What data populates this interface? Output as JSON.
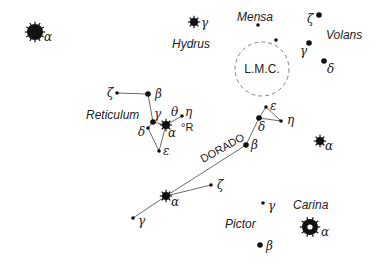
{
  "constellations": {
    "hydrus": {
      "label": "Hydrus",
      "x": 172,
      "y": 48
    },
    "mensa": {
      "label": "Mensa",
      "x": 237,
      "y": 21
    },
    "volans": {
      "label": "Volans",
      "x": 326,
      "y": 39
    },
    "reticulum": {
      "label": "Reticulum",
      "x": 86,
      "y": 119
    },
    "dorado": {
      "label": "DORADO",
      "x": 203,
      "y": 163,
      "rotate": -29
    },
    "carina": {
      "label": "Carina",
      "x": 293,
      "y": 209
    },
    "pictor": {
      "label": "Pictor",
      "x": 225,
      "y": 228
    }
  },
  "lmc": {
    "label": "L.M.C.",
    "cx": 262,
    "cy": 69,
    "r": 27
  },
  "r_marker": {
    "label": "°R",
    "x": 181,
    "y": 131
  },
  "stars": [
    {
      "id": "hyi-alpha",
      "greek": "α",
      "x": 35,
      "y": 32,
      "size": "xl",
      "lx": 44,
      "ly": 41
    },
    {
      "id": "hyi-gamma",
      "greek": "γ",
      "x": 194,
      "y": 22,
      "size": "m-spiky",
      "lx": 201,
      "ly": 27
    },
    {
      "id": "men-a",
      "greek": "",
      "x": 258,
      "y": 25,
      "size": "xs",
      "lx": 0,
      "ly": 0
    },
    {
      "id": "men-b",
      "greek": "",
      "x": 276,
      "y": 40,
      "size": "xs",
      "lx": 0,
      "ly": 0
    },
    {
      "id": "vol-zeta",
      "greek": "ζ",
      "x": 319,
      "y": 15,
      "size": "s",
      "lx": 307,
      "ly": 23
    },
    {
      "id": "vol-gamma",
      "greek": "γ",
      "x": 309,
      "y": 43,
      "size": "s",
      "lx": 300,
      "ly": 55
    },
    {
      "id": "vol-delta",
      "greek": "δ",
      "x": 324,
      "y": 61,
      "size": "s",
      "lx": 327,
      "ly": 73
    },
    {
      "id": "ret-zeta",
      "greek": "ζ",
      "x": 117,
      "y": 93,
      "size": "xs",
      "lx": 107,
      "ly": 97
    },
    {
      "id": "ret-beta",
      "greek": "β",
      "x": 148,
      "y": 94,
      "size": "s",
      "lx": 155,
      "ly": 98
    },
    {
      "id": "ret-gamma",
      "greek": "γ",
      "x": 153,
      "y": 122,
      "size": "s",
      "lx": 154,
      "ly": 118
    },
    {
      "id": "ret-alpha",
      "greek": "α",
      "x": 166,
      "y": 125,
      "size": "m-spiky",
      "lx": 168,
      "ly": 137
    },
    {
      "id": "ret-eta",
      "greek": "θ",
      "x": 182,
      "y": 116,
      "size": "xs",
      "lx": 171,
      "ly": 116
    },
    {
      "id": "ret-eta-label",
      "greek": "η",
      "x": 0,
      "y": 0,
      "size": "none",
      "lx": 185,
      "ly": 116
    },
    {
      "id": "ret-delta",
      "greek": "δ",
      "x": 148,
      "y": 128,
      "size": "xs",
      "lx": 138,
      "ly": 136
    },
    {
      "id": "ret-epsilon",
      "greek": "ε",
      "x": 159,
      "y": 151,
      "size": "xs",
      "lx": 163,
      "ly": 155
    },
    {
      "id": "dor-epsilon",
      "greek": "ε",
      "x": 266,
      "y": 107,
      "size": "xs",
      "lx": 270,
      "ly": 110
    },
    {
      "id": "dor-delta",
      "greek": "δ",
      "x": 259,
      "y": 118,
      "size": "s",
      "lx": 258,
      "ly": 131
    },
    {
      "id": "dor-eta",
      "greek": "η",
      "x": 281,
      "y": 121,
      "size": "xs",
      "lx": 287,
      "ly": 124
    },
    {
      "id": "dor-beta",
      "greek": "β",
      "x": 246,
      "y": 145,
      "size": "s",
      "lx": 251,
      "ly": 149
    },
    {
      "id": "dor-zeta",
      "greek": "ζ",
      "x": 211,
      "y": 185,
      "size": "xs",
      "lx": 217,
      "ly": 189
    },
    {
      "id": "dor-alpha",
      "greek": "α",
      "x": 166,
      "y": 196,
      "size": "m-spiky",
      "lx": 171,
      "ly": 206
    },
    {
      "id": "dor-gamma",
      "greek": "γ",
      "x": 133,
      "y": 218,
      "size": "xs",
      "lx": 138,
      "ly": 225
    },
    {
      "id": "car-beta-star",
      "greek": "α",
      "x": 320,
      "y": 141,
      "size": "m-spiky",
      "lx": 325,
      "ly": 150
    },
    {
      "id": "pic-gamma",
      "greek": "γ",
      "x": 263,
      "y": 203,
      "size": "xs",
      "lx": 268,
      "ly": 210
    },
    {
      "id": "pic-beta",
      "greek": "β",
      "x": 260,
      "y": 245,
      "size": "s",
      "lx": 266,
      "ly": 250
    },
    {
      "id": "car-alpha",
      "greek": "α",
      "x": 310,
      "y": 227,
      "size": "xl-ring",
      "lx": 321,
      "ly": 236
    }
  ],
  "lines": [
    {
      "from": "ret-zeta",
      "to": "ret-beta"
    },
    {
      "from": "ret-beta",
      "to": "ret-gamma"
    },
    {
      "from": "ret-gamma",
      "to": "ret-alpha"
    },
    {
      "from": "ret-alpha",
      "to": "ret-eta"
    },
    {
      "from": "ret-gamma",
      "to": "ret-delta"
    },
    {
      "from": "ret-delta",
      "to": "ret-epsilon"
    },
    {
      "from": "ret-alpha",
      "to": "ret-epsilon"
    },
    {
      "from": "dor-gamma",
      "to": "dor-alpha"
    },
    {
      "from": "dor-alpha",
      "to": "dor-beta"
    },
    {
      "from": "dor-alpha",
      "to": "dor-zeta"
    },
    {
      "from": "dor-beta",
      "to": "dor-delta"
    },
    {
      "from": "dor-delta",
      "to": "dor-epsilon"
    },
    {
      "from": "dor-epsilon",
      "to": "dor-eta"
    },
    {
      "from": "dor-delta",
      "to": "dor-eta"
    }
  ]
}
